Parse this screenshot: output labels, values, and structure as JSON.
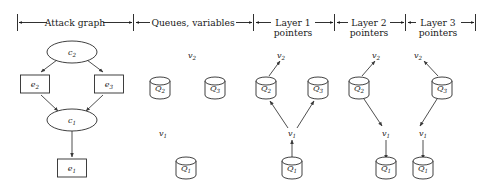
{
  "figure": {
    "width": 478,
    "height": 194,
    "background": "#ffffff",
    "ink": "#1a1a1a",
    "edge_color": "#3a3a3a"
  },
  "sections": [
    {
      "id": "attack-graph",
      "label": "Attack graph",
      "label2": "",
      "x0": 17,
      "x1": 133
    },
    {
      "id": "queues-variables",
      "label": "Queues, variables",
      "label2": "",
      "x0": 135,
      "x1": 252
    },
    {
      "id": "layer-1-pointers",
      "label": "Layer 1",
      "label2": "pointers",
      "x0": 254,
      "x1": 333
    },
    {
      "id": "layer-2-pointers",
      "label": "Layer 2",
      "label2": "pointers",
      "x0": 335,
      "x1": 404
    },
    {
      "id": "layer-3-pointers",
      "label": "Layer 3",
      "label2": "pointers",
      "x0": 406,
      "x1": 475
    }
  ],
  "attack_graph": {
    "nodes": [
      {
        "id": "c2",
        "label": "c",
        "sub": "2",
        "shape": "ellipse",
        "cx": 72,
        "cy": 52,
        "rx": 25,
        "ry": 11
      },
      {
        "id": "e2",
        "label": "e",
        "sub": "2",
        "shape": "rect",
        "cx": 35,
        "cy": 84,
        "w": 29,
        "h": 18
      },
      {
        "id": "e3",
        "label": "e",
        "sub": "3",
        "shape": "rect",
        "cx": 109,
        "cy": 84,
        "w": 29,
        "h": 18
      },
      {
        "id": "c1",
        "label": "c",
        "sub": "1",
        "shape": "ellipse",
        "cx": 72,
        "cy": 120,
        "rx": 25,
        "ry": 11
      },
      {
        "id": "e1",
        "label": "e",
        "sub": "1",
        "shape": "rect",
        "cx": 72,
        "cy": 168,
        "w": 29,
        "h": 18
      }
    ],
    "edges": [
      {
        "from": "c2",
        "to": "e2"
      },
      {
        "from": "c2",
        "to": "e3"
      },
      {
        "from": "e2",
        "to": "c1"
      },
      {
        "from": "e3",
        "to": "c1"
      },
      {
        "from": "c1",
        "to": "e1"
      }
    ]
  },
  "queues_column": {
    "queues": [
      {
        "id": "Q2",
        "label": "Q",
        "sub": "2",
        "cx": 160,
        "cy": 88
      },
      {
        "id": "Q3",
        "label": "Q",
        "sub": "3",
        "cx": 215,
        "cy": 88
      },
      {
        "id": "Q1",
        "label": "Q",
        "sub": "1",
        "cx": 186,
        "cy": 168
      }
    ],
    "variables": [
      {
        "id": "v2",
        "label": "v",
        "sub": "2",
        "x": 192,
        "y": 55
      },
      {
        "id": "v1",
        "label": "v",
        "sub": "1",
        "x": 163,
        "y": 133
      }
    ]
  },
  "layer1": {
    "queues": [
      {
        "id": "Q2",
        "label": "Q",
        "sub": "2",
        "cx": 266,
        "cy": 88
      },
      {
        "id": "Q3",
        "label": "Q",
        "sub": "3",
        "cx": 318,
        "cy": 88
      },
      {
        "id": "Q1",
        "label": "Q",
        "sub": "1",
        "cx": 292,
        "cy": 168
      }
    ],
    "variables": [
      {
        "id": "v2",
        "label": "v",
        "sub": "2",
        "x": 281,
        "y": 55
      },
      {
        "id": "v1",
        "label": "v",
        "sub": "1",
        "x": 292,
        "y": 133
      }
    ],
    "arrows": [
      {
        "from": "Q1",
        "to": "v1",
        "dir": "up"
      },
      {
        "from": "v1",
        "to": "Q2",
        "dir": "up-left"
      },
      {
        "from": "v1",
        "to": "Q3",
        "dir": "up-right"
      },
      {
        "from": "Q2",
        "to": "v2",
        "dir": "up-right"
      }
    ]
  },
  "layer2": {
    "queues": [
      {
        "id": "Q2",
        "label": "Q",
        "sub": "2",
        "cx": 359,
        "cy": 88
      },
      {
        "id": "Q1",
        "label": "Q",
        "sub": "1",
        "cx": 386,
        "cy": 168
      }
    ],
    "variables": [
      {
        "id": "v2",
        "label": "v",
        "sub": "2",
        "x": 376,
        "y": 55
      },
      {
        "id": "v1",
        "label": "v",
        "sub": "1",
        "x": 386,
        "y": 133
      }
    ],
    "arrows": [
      {
        "from": "Q2",
        "to": "v2",
        "dir": "up-right"
      },
      {
        "from": "Q2",
        "to": "v1",
        "dir": "down-right"
      },
      {
        "from": "v1",
        "to": "Q1",
        "dir": "down"
      }
    ]
  },
  "layer3": {
    "queues": [
      {
        "id": "Q3",
        "label": "Q",
        "sub": "3",
        "cx": 442,
        "cy": 88
      },
      {
        "id": "Q1",
        "label": "Q",
        "sub": "1",
        "cx": 423,
        "cy": 168
      }
    ],
    "variables": [
      {
        "id": "v2",
        "label": "v",
        "sub": "2",
        "x": 418,
        "y": 55
      },
      {
        "id": "v1",
        "label": "v",
        "sub": "1",
        "x": 423,
        "y": 133
      }
    ],
    "arrows": [
      {
        "from": "Q3",
        "to": "v2",
        "dir": "up-left"
      },
      {
        "from": "Q3",
        "to": "v1",
        "dir": "down-left"
      },
      {
        "from": "v1",
        "to": "Q1",
        "dir": "down"
      }
    ]
  }
}
